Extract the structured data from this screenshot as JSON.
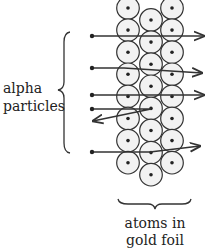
{
  "labels": {
    "alpha_line1": "alpha",
    "alpha_line2": "particles",
    "foil_line1": "atoms in",
    "foil_line2": "gold foil"
  },
  "atoms": {
    "columns": [
      {
        "name": "left",
        "count": 8
      },
      {
        "name": "middle",
        "count": 8
      },
      {
        "name": "right",
        "count": 8
      }
    ]
  },
  "particles": [
    {
      "name": "particle-1",
      "behavior": "passes straight through"
    },
    {
      "name": "particle-2",
      "behavior": "slight downward deflection"
    },
    {
      "name": "particle-3",
      "behavior": "passes straight through"
    },
    {
      "name": "particle-4",
      "behavior": "bounces back from nucleus"
    },
    {
      "name": "particle-5",
      "behavior": "slight upward deflection"
    }
  ],
  "colors": {
    "stroke": "#333333",
    "atom_fill": "#f2f2f2",
    "nucleus": "#222222"
  }
}
